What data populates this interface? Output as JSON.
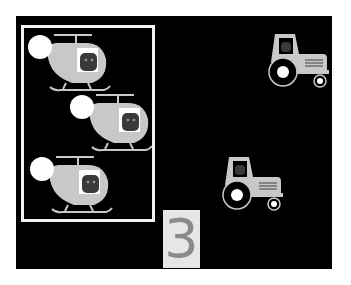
{
  "scene": {
    "background": "#000000",
    "group_box": {
      "label": "helicopter-group",
      "border_color": "#f2f2f2",
      "items": [
        {
          "type": "helicopter",
          "x": 10,
          "y": 15
        },
        {
          "type": "helicopter",
          "x": 52,
          "y": 75
        },
        {
          "type": "helicopter",
          "x": 12,
          "y": 137
        }
      ]
    },
    "outside_items": [
      {
        "type": "tractor",
        "x": 249,
        "y": 12
      },
      {
        "type": "tractor",
        "x": 203,
        "y": 135
      }
    ],
    "count": {
      "value": "3",
      "box_color": "#e6e6e6",
      "digit_color": "#8a8a8a"
    },
    "colors": {
      "vehicle_body": "#c8c8c8",
      "highlight": "#ffffff",
      "pilot": "#3a3a3a"
    }
  }
}
